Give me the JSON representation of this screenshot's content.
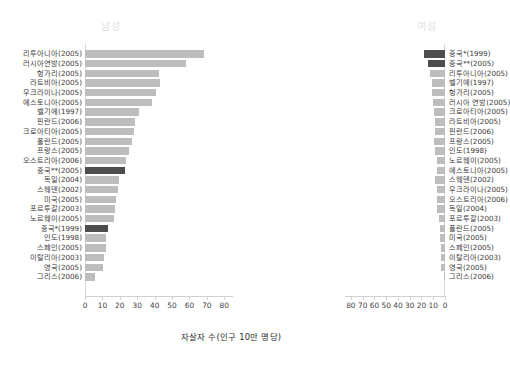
{
  "headers": {
    "male": "남성",
    "female": "여성"
  },
  "axis": {
    "xlabel": "자살자 수(인구 10만 명당)",
    "ticks": [
      0,
      10,
      20,
      30,
      40,
      50,
      60,
      70,
      80
    ],
    "ticks_right": [
      80,
      70,
      60,
      50,
      40,
      30,
      20,
      10,
      0
    ]
  },
  "colors": {
    "bar": "#bdbdbd",
    "bar_highlight": "#4d4d4d",
    "axis": "#d0d0d0",
    "header_text": "#e2e2e2",
    "label_text": "#3a3a3a"
  },
  "chart_data": {
    "type": "bar",
    "title": "",
    "subtitle": "",
    "xlabel": "자살자 수(인구 10만 명당)",
    "ylabel": "",
    "orientation": "horizontal",
    "layout": "back-to-back population pyramid",
    "xlim": [
      0,
      85
    ],
    "grid": false,
    "legend": [
      {
        "label": "남성",
        "position": "top-left-panel"
      },
      {
        "label": "여성",
        "position": "top-right-panel"
      }
    ],
    "series": [
      {
        "name": "남성",
        "panel": "left",
        "direction": "left-to-right",
        "categories": [
          "리투아니아(2005)",
          "러시아연방(2005)",
          "헝가리(2005)",
          "라트비아(2005)",
          "우크라이나(2005)",
          "에스토니아(2005)",
          "벨기에(1997)",
          "핀란드(2006)",
          "크로아티아(2005)",
          "폴란드(2005)",
          "프랑스(2005)",
          "오스트리아(2006)",
          "중국**(2005)",
          "독일(2004)",
          "스웨덴(2002)",
          "미국(2005)",
          "포르투갈(2003)",
          "노르웨이(2005)",
          "중국*(1999)",
          "인도(1998)",
          "스페인(2005)",
          "이탈리아(2003)",
          "영국(2005)",
          "그리스(2006)"
        ],
        "values": [
          68.1,
          58.1,
          42.3,
          42.9,
          40.9,
          38.3,
          31.2,
          28.9,
          28.0,
          26.8,
          25.5,
          23.8,
          23.0,
          19.7,
          18.9,
          17.7,
          17.5,
          16.8,
          13.4,
          12.2,
          12.0,
          11.0,
          10.4,
          5.9
        ]
      },
      {
        "name": "여성",
        "panel": "right",
        "direction": "right-to-left",
        "categories": [
          "중국*(1999)",
          "중국**(2005)",
          "리투아니아(2005)",
          "벨기에(1997)",
          "헝가리(2005)",
          "러시아 연방(2005)",
          "크로아티아(2005)",
          "라트비아(2005)",
          "핀란드(2006)",
          "프랑스(2005)",
          "인도(1998)",
          "노르웨이(2005)",
          "에스토니아(2005)",
          "스웨덴(2002)",
          "우크라이나(2005)",
          "오스트리아(2006)",
          "독일(2004)",
          "포르투갈(2003)",
          "폴란드(2005)",
          "미국(2005)",
          "스페인(2005)",
          "이탈리아(2003)",
          "영국(2005)",
          "그리스(2006)"
        ],
        "values": [
          17.9,
          14.8,
          12.9,
          11.4,
          11.2,
          9.8,
          9.5,
          8.5,
          8.4,
          9.0,
          8.3,
          7.0,
          7.0,
          8.1,
          7.0,
          7.1,
          6.6,
          5.0,
          4.6,
          4.4,
          3.8,
          3.2,
          3.1,
          1.2
        ]
      }
    ],
    "highlighted_categories": [
      "중국**(2005)",
      "중국*(1999)"
    ]
  }
}
